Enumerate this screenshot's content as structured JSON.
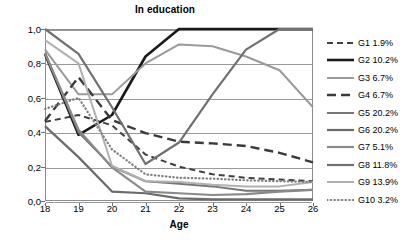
{
  "chart_data": {
    "type": "line",
    "title": "In education",
    "xlabel": "Age",
    "ylabel": "",
    "x": [
      18,
      19,
      20,
      21,
      22,
      23,
      24,
      25,
      26
    ],
    "xlim": [
      18,
      26
    ],
    "ylim": [
      0.0,
      1.0
    ],
    "xtick_labels": [
      "18",
      "19",
      "20",
      "21",
      "22",
      "23",
      "24",
      "25",
      "26"
    ],
    "ytick_labels": [
      "0,0",
      "0,2",
      "0,4",
      "0,6",
      "0,8",
      "1,0"
    ],
    "ytick_values": [
      0.0,
      0.2,
      0.4,
      0.6,
      0.8,
      1.0
    ],
    "grid": true,
    "legend_position": "right",
    "series": [
      {
        "name": "G1 1.9%",
        "label": "G1 1.9%",
        "color": "#3f3f3f",
        "style": "dashed",
        "width": 2.0,
        "dash": "6,4",
        "values": [
          0.46,
          0.5,
          0.44,
          0.27,
          0.2,
          0.155,
          0.135,
          0.125,
          0.115
        ]
      },
      {
        "name": "G2 10.2%",
        "label": "G2 10.2%",
        "color": "#1a1a1a",
        "style": "solid",
        "width": 2.6,
        "dash": "",
        "values": [
          0.855,
          0.385,
          0.5,
          0.84,
          1.0,
          1.0,
          1.0,
          1.0,
          1.0
        ]
      },
      {
        "name": "G3 6.7%",
        "label": "G3 6.7%",
        "color": "#9a9a9a",
        "style": "solid",
        "width": 2.0,
        "dash": "",
        "values": [
          0.88,
          0.62,
          0.62,
          0.8,
          0.91,
          0.9,
          0.84,
          0.76,
          0.545
        ]
      },
      {
        "name": "G4 6.7%",
        "label": "G4 6.7%",
        "color": "#3a3a3a",
        "style": "dashed",
        "width": 2.4,
        "dash": "9,5",
        "values": [
          0.465,
          0.72,
          0.47,
          0.395,
          0.345,
          0.335,
          0.32,
          0.28,
          0.225
        ]
      },
      {
        "name": "G5 20.2%",
        "label": "G5 20.2%",
        "color": "#757575",
        "style": "solid",
        "width": 2.0,
        "dash": "",
        "values": [
          0.86,
          0.4,
          0.2,
          0.115,
          0.1,
          0.085,
          0.06,
          0.06,
          0.065
        ]
      },
      {
        "name": "G6 20.2%",
        "label": "G6 20.2%",
        "color": "#6b6b6b",
        "style": "solid",
        "width": 2.2,
        "dash": "",
        "values": [
          0.435,
          0.255,
          0.055,
          0.045,
          0.015,
          0.01,
          0.01,
          0.01,
          0.01
        ]
      },
      {
        "name": "G7 5.1%",
        "label": "G7 5.1%",
        "color": "#8a8a8a",
        "style": "solid",
        "width": 2.2,
        "dash": "",
        "values": [
          0.86,
          0.415,
          0.195,
          0.055,
          0.045,
          0.035,
          0.04,
          0.055,
          0.065
        ]
      },
      {
        "name": "G8 11.8%",
        "label": "G8 11.8%",
        "color": "#707070",
        "style": "solid",
        "width": 2.2,
        "dash": "",
        "values": [
          1.0,
          0.855,
          0.545,
          0.215,
          0.34,
          0.62,
          0.88,
          1.0,
          1.0
        ]
      },
      {
        "name": "G9 13.9%",
        "label": "G9 13.9%",
        "color": "#b0b0b0",
        "style": "solid",
        "width": 2.0,
        "dash": "",
        "values": [
          0.935,
          0.8,
          0.205,
          0.115,
          0.11,
          0.095,
          0.085,
          0.085,
          0.11
        ]
      },
      {
        "name": "G10 3.2%",
        "label": "G10 3.2%",
        "color": "#7d7d7d",
        "style": "dotted",
        "width": 2.2,
        "dash": "0.5,3.2",
        "values": [
          0.535,
          0.6,
          0.3,
          0.155,
          0.135,
          0.13,
          0.12,
          0.115,
          0.11
        ]
      }
    ]
  }
}
